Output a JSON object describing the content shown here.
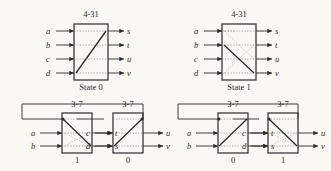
{
  "figure": {
    "background_color": "#faf8f2",
    "ink_color": "#2b2b2b",
    "dash_color": "#8d8d8d"
  },
  "top_row": {
    "switches": [
      {
        "title": "4-31",
        "caption": "State 0",
        "inputs": [
          "a",
          "b",
          "c",
          "d"
        ],
        "outputs": [
          "s",
          "t",
          "u",
          "v"
        ],
        "diagonal": "bottom-left-to-top-right"
      },
      {
        "title": "4-31",
        "caption": "State 1",
        "inputs": [
          "a",
          "b",
          "c",
          "d"
        ],
        "outputs": [
          "s",
          "t",
          "u",
          "v"
        ],
        "diagonal": "top-left-to-bottom-right"
      }
    ]
  },
  "bottom_row": {
    "groups": [
      {
        "blocks": [
          {
            "title": "3-7",
            "caption": "1",
            "inputs": [
              "a",
              "b"
            ],
            "outputs": [
              "t",
              "s"
            ],
            "diagonal": "top-left-to-bottom-right"
          },
          {
            "title": "3-7",
            "caption": "0",
            "inputs": [
              "c",
              "d"
            ],
            "outputs": [
              "u",
              "v"
            ],
            "diagonal": "bottom-left-to-top-right"
          }
        ]
      },
      {
        "blocks": [
          {
            "title": "3-7",
            "caption": "0",
            "inputs": [
              "a",
              "b"
            ],
            "outputs": [
              "t",
              "s"
            ],
            "diagonal": "bottom-left-to-top-right"
          },
          {
            "title": "3-7",
            "caption": "1",
            "inputs": [
              "c",
              "d"
            ],
            "outputs": [
              "u",
              "v"
            ],
            "diagonal": "top-left-to-bottom-right"
          }
        ]
      }
    ]
  }
}
